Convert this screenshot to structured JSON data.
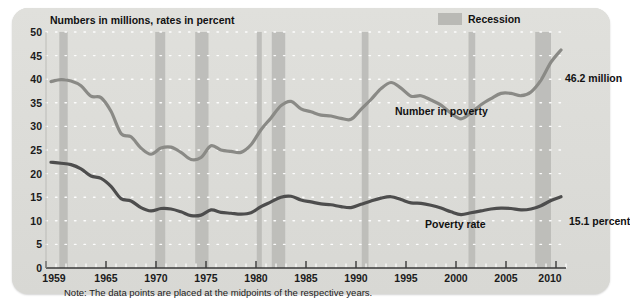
{
  "figure": {
    "axis_title": "Numbers in millions, rates in percent",
    "note": "Note: The data points are placed at the midpoints of the respective years."
  },
  "legend": {
    "recession_label": "Recession",
    "recession_color": "#b9b9b5"
  },
  "annotations": {
    "number_in_poverty": "Number in poverty",
    "poverty_rate": "Poverty rate",
    "end_number": "46.2 million",
    "end_rate": "15.1 percent"
  },
  "chart_data": {
    "type": "line",
    "title": "",
    "subtitle": "",
    "xlabel": "",
    "ylabel": "Numbers in millions, rates in percent",
    "xlim": [
      1959,
      2010
    ],
    "ylim": [
      0,
      50
    ],
    "ytick_labels": [
      "0",
      "5",
      "10",
      "15",
      "20",
      "25",
      "30",
      "35",
      "40",
      "45",
      "50"
    ],
    "ytick_values": [
      0,
      5,
      10,
      15,
      20,
      25,
      30,
      35,
      40,
      45,
      50
    ],
    "xtick_labels": [
      "1959",
      "1965",
      "1970",
      "1975",
      "1980",
      "1985",
      "1990",
      "1995",
      "2000",
      "2005",
      "2010"
    ],
    "xtick_values": [
      1959,
      1965,
      1970,
      1975,
      1980,
      1985,
      1990,
      1995,
      2000,
      2005,
      2010
    ],
    "minor_xticks_every": 1,
    "grid": "dotted-horizontal-white",
    "legend_position": "top-right",
    "x": [
      1959,
      1960,
      1961,
      1962,
      1963,
      1964,
      1965,
      1966,
      1967,
      1968,
      1969,
      1970,
      1971,
      1972,
      1973,
      1974,
      1975,
      1976,
      1977,
      1978,
      1979,
      1980,
      1981,
      1982,
      1983,
      1984,
      1985,
      1986,
      1987,
      1988,
      1989,
      1990,
      1991,
      1992,
      1993,
      1994,
      1995,
      1996,
      1997,
      1998,
      1999,
      2000,
      2001,
      2002,
      2003,
      2004,
      2005,
      2006,
      2007,
      2008,
      2009,
      2010
    ],
    "series": [
      {
        "name": "Number in poverty",
        "units": "millions",
        "color": "#8a8a86",
        "end_label": "46.2 million",
        "values": [
          39.5,
          39.9,
          39.6,
          38.6,
          36.4,
          36.1,
          33.2,
          28.5,
          27.8,
          25.4,
          24.1,
          25.4,
          25.6,
          24.5,
          23.0,
          23.4,
          25.9,
          25.0,
          24.7,
          24.5,
          26.1,
          29.3,
          31.8,
          34.4,
          35.3,
          33.7,
          33.1,
          32.4,
          32.2,
          31.7,
          31.5,
          33.6,
          35.7,
          38.0,
          39.3,
          38.1,
          36.4,
          36.5,
          35.6,
          34.5,
          32.8,
          31.6,
          32.9,
          34.6,
          35.9,
          37.0,
          37.0,
          36.5,
          37.3,
          39.8,
          43.6,
          46.2
        ]
      },
      {
        "name": "Poverty rate",
        "units": "percent",
        "color": "#4d4d4d",
        "end_label": "15.1 percent",
        "values": [
          22.4,
          22.2,
          21.9,
          21.0,
          19.5,
          19.0,
          17.3,
          14.7,
          14.2,
          12.8,
          12.1,
          12.6,
          12.5,
          11.9,
          11.1,
          11.2,
          12.3,
          11.8,
          11.6,
          11.4,
          11.7,
          13.0,
          14.0,
          15.0,
          15.2,
          14.4,
          14.0,
          13.6,
          13.4,
          13.0,
          12.8,
          13.5,
          14.2,
          14.8,
          15.1,
          14.5,
          13.8,
          13.7,
          13.3,
          12.7,
          11.9,
          11.3,
          11.7,
          12.1,
          12.5,
          12.7,
          12.6,
          12.3,
          12.5,
          13.2,
          14.3,
          15.1
        ]
      }
    ],
    "recessions": [
      {
        "start": 1960.33,
        "end": 1961.17
      },
      {
        "start": 1969.92,
        "end": 1970.92
      },
      {
        "start": 1973.92,
        "end": 1975.25
      },
      {
        "start": 1980.08,
        "end": 1980.58
      },
      {
        "start": 1981.58,
        "end": 1982.92
      },
      {
        "start": 1990.58,
        "end": 1991.25
      },
      {
        "start": 2001.25,
        "end": 2001.92
      },
      {
        "start": 2007.92,
        "end": 2009.5
      }
    ]
  }
}
